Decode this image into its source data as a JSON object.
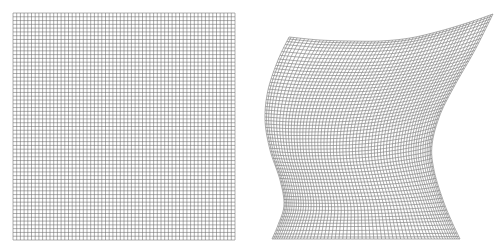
{
  "figure": {
    "panels": [
      {
        "id": "original-grid",
        "description": "Regular square mesh grid",
        "rows": 60,
        "cols": 60,
        "bounds": {
          "x0": 13,
          "y0": 13,
          "x1": 235,
          "y1": 240
        }
      },
      {
        "id": "warped-grid",
        "description": "Same mesh grid after non-linear deformation",
        "rows": 60,
        "cols": 60,
        "boundary": {
          "top": [
            [
              289,
              37
            ],
            [
              320,
              40
            ],
            [
              350,
              41
            ],
            [
              380,
              41
            ],
            [
              410,
              38
            ],
            [
              440,
              31
            ],
            [
              470,
              22
            ],
            [
              493,
              14
            ]
          ],
          "bottom": [
            [
              272,
              239
            ],
            [
              460,
              239
            ]
          ],
          "left": [
            [
              289,
              37
            ],
            [
              278,
              60
            ],
            [
              268,
              90
            ],
            [
              265,
              120
            ],
            [
              270,
              150
            ],
            [
              280,
              180
            ],
            [
              284,
              205
            ],
            [
              278,
              225
            ],
            [
              272,
              239
            ]
          ],
          "right": [
            [
              493,
              14
            ],
            [
              475,
              50
            ],
            [
              455,
              85
            ],
            [
              440,
              115
            ],
            [
              432,
              145
            ],
            [
              434,
              170
            ],
            [
              443,
              200
            ],
            [
              452,
              222
            ],
            [
              460,
              239
            ]
          ]
        }
      }
    ],
    "colors": {
      "line": "#6a6a6a",
      "background": "#ffffff"
    }
  }
}
